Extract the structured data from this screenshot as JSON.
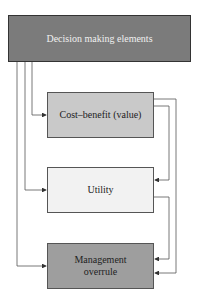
{
  "diagram": {
    "top": {
      "label": "Decision making elements",
      "color": "#7b7b7b"
    },
    "boxes": [
      {
        "id": "cost-benefit",
        "label": "Cost–benefit (value)",
        "color": "#c9c9c9"
      },
      {
        "id": "utility",
        "label": "Utility",
        "color": "#f2f2f2"
      },
      {
        "id": "management",
        "label": "Management overrule",
        "color": "#9e9e9e"
      }
    ]
  }
}
